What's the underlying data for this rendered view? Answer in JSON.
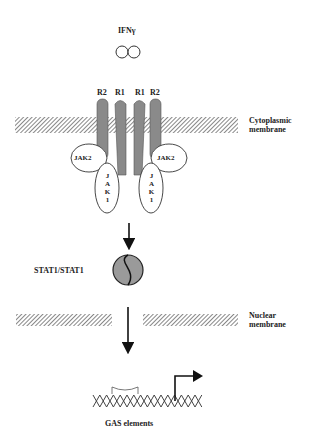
{
  "ligand": {
    "label": "IFNγ"
  },
  "receptors": [
    {
      "label": "R2"
    },
    {
      "label": "R1"
    },
    {
      "label": "R1"
    },
    {
      "label": "R2"
    }
  ],
  "kinases": {
    "jak2_left": "JAK2",
    "jak2_right": "JAK2",
    "jak1_left": [
      "J",
      "A",
      "K",
      "1"
    ],
    "jak1_right": [
      "J",
      "A",
      "K",
      "1"
    ]
  },
  "labels": {
    "cytoplasmic_line1": "Cytoplasmic",
    "cytoplasmic_line2": "membrane",
    "stat": "STAT1/STAT1",
    "nuclear_line1": "Nuclear",
    "nuclear_line2": "membrane",
    "gas": "GAS elements"
  },
  "colors": {
    "receptor": "#8a8a8a",
    "stat": "#9a9a9a",
    "hatch": "#555555"
  }
}
